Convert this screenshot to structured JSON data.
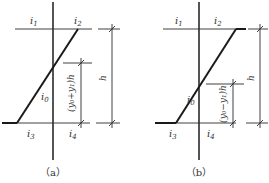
{
  "panels": [
    {
      "id": "a",
      "caption": "（a）",
      "labels": {
        "i1": "i",
        "i1_sub": "1",
        "i2": "i",
        "i2_sub": "2",
        "i3": "i",
        "i3_sub": "3",
        "i4": "i",
        "i4_sub": "4",
        "i0": "i",
        "i0_sub": "0"
      },
      "inner_dimension": "(y₀+y₁)h",
      "outer_dimension": "h"
    },
    {
      "id": "b",
      "caption": "（b）",
      "labels": {
        "i1": "i",
        "i1_sub": "1",
        "i2": "i",
        "i2_sub": "2",
        "i3": "i",
        "i3_sub": "3",
        "i4": "i",
        "i4_sub": "4",
        "i0": "i",
        "i0_sub": "0"
      },
      "inner_dimension": "(y₀−y₁)h",
      "outer_dimension": "h"
    }
  ]
}
